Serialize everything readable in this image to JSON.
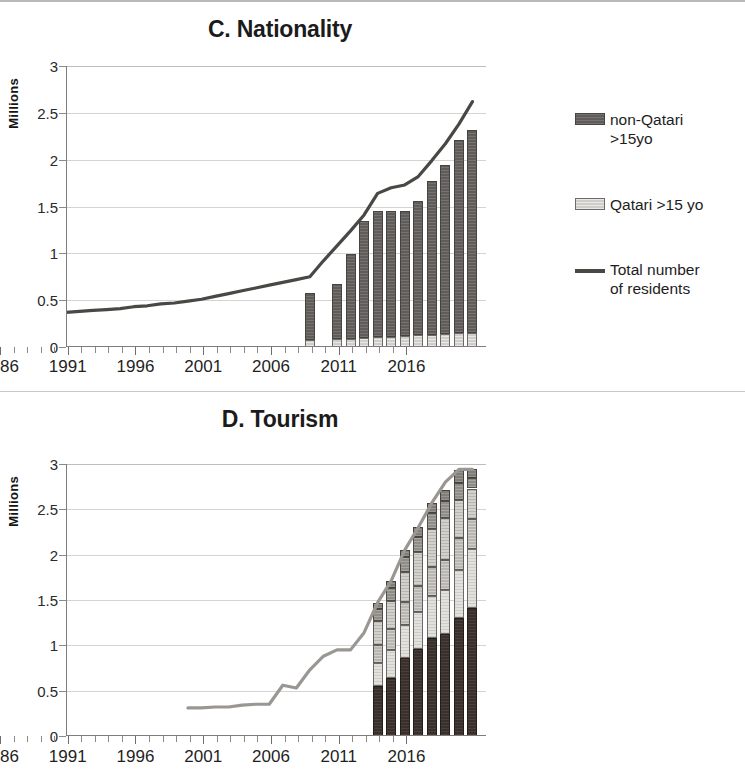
{
  "figure": {
    "panels": [
      "C. Nationality",
      "D. Tourism"
    ]
  },
  "panel_c": {
    "title": "C. Nationality",
    "y_axis_title": "Millions",
    "y_ticks": [
      "3",
      "2.5",
      "2",
      "1.5",
      "1",
      "0.5",
      "0"
    ],
    "x_labels": [
      "1986",
      "1991",
      "1996",
      "2001",
      "2006",
      "2011",
      "2016"
    ],
    "legend": [
      {
        "label": "non-Qatari\n>15yo",
        "type": "swatch",
        "fill": "f-nonqatari",
        "color": "#5f5c59"
      },
      {
        "label": "Qatari >15 yo",
        "type": "swatch",
        "fill": "f-qatari",
        "color": "#cfcdc9"
      },
      {
        "label": "Total number\nof residents",
        "type": "line",
        "fill": "line-swatch",
        "color": "#4a4845"
      }
    ]
  },
  "panel_d": {
    "title": "D. Tourism",
    "y_axis_title": "Millions",
    "y_ticks": [
      "3",
      "2.5",
      "2",
      "1.5",
      "1",
      "0.5",
      "0"
    ],
    "x_labels": [
      "1986",
      "1991",
      "1996",
      "2001",
      "2006",
      "2011",
      "2016"
    ],
    "legend": [
      {
        "label": "Other African\ncountries",
        "type": "swatch",
        "fill": "f-african",
        "color": "#817e79"
      },
      {
        "label": "Americas",
        "type": "swatch",
        "fill": "f-americas",
        "color": "#908d88"
      },
      {
        "label": "Other Arab\ncountries*",
        "type": "swatch",
        "fill": "f-arab",
        "color": "#d3d1cc"
      },
      {
        "label": "Europe",
        "type": "swatch",
        "fill": "f-europe",
        "color": "#b9b6b1"
      },
      {
        "label": "Asia and Oceania",
        "type": "swatch",
        "fill": "f-asia",
        "color": "#e3e1dd"
      },
      {
        "label": "GCC countries**",
        "type": "swatch",
        "fill": "f-gcc",
        "color": "#3a302b"
      },
      {
        "label": "Total number of\nincoming tourists",
        "type": "line",
        "fill": "line-swatch-light",
        "color": "#9a9793"
      }
    ]
  },
  "chart_data": [
    {
      "type": "bar",
      "id": "panel-c",
      "title": "C. Nationality",
      "xlabel": "",
      "ylabel": "Millions",
      "ylim": [
        0,
        3
      ],
      "ytick_step": 0.5,
      "xlim": [
        1986,
        2017
      ],
      "grid": true,
      "legend_position": "right",
      "stacked": true,
      "bar_categories": [
        2004,
        2006,
        2007,
        2008,
        2009,
        2010,
        2011,
        2012,
        2013,
        2014,
        2015,
        2016
      ],
      "series": [
        {
          "name": "Qatari >15 yo",
          "stack_order": 0,
          "values": [
            0.07,
            0.09,
            0.09,
            0.1,
            0.11,
            0.11,
            0.12,
            0.13,
            0.13,
            0.14,
            0.15,
            0.15
          ]
        },
        {
          "name": "non-Qatari >15yo",
          "stack_order": 1,
          "values": [
            0.51,
            0.58,
            0.9,
            1.25,
            1.34,
            1.34,
            1.33,
            1.43,
            1.64,
            1.8,
            2.06,
            2.17
          ]
        }
      ],
      "bar_totals": [
        0.58,
        0.67,
        0.99,
        1.35,
        1.45,
        1.45,
        1.45,
        1.56,
        1.77,
        1.94,
        2.21,
        2.32
      ],
      "line_series": {
        "name": "Total number of residents",
        "x": [
          1986,
          1987,
          1988,
          1989,
          1990,
          1991,
          1992,
          1993,
          1994,
          1995,
          1996,
          1997,
          1998,
          1999,
          2000,
          2001,
          2002,
          2003,
          2004,
          2005,
          2006,
          2007,
          2008,
          2009,
          2010,
          2011,
          2012,
          2013,
          2014,
          2015,
          2016
        ],
        "y": [
          0.37,
          0.38,
          0.39,
          0.4,
          0.41,
          0.43,
          0.44,
          0.46,
          0.47,
          0.49,
          0.51,
          0.54,
          0.57,
          0.6,
          0.63,
          0.66,
          0.69,
          0.72,
          0.75,
          0.92,
          1.08,
          1.24,
          1.41,
          1.64,
          1.7,
          1.73,
          1.82,
          1.99,
          2.17,
          2.38,
          2.62
        ]
      }
    },
    {
      "type": "bar",
      "id": "panel-d",
      "title": "D. Tourism",
      "xlabel": "",
      "ylabel": "Millions",
      "ylim": [
        0,
        3
      ],
      "ytick_step": 0.5,
      "xlim": [
        1986,
        2017
      ],
      "grid": true,
      "legend_position": "right",
      "stacked": true,
      "bar_categories": [
        2009,
        2010,
        2011,
        2012,
        2013,
        2014,
        2015,
        2016
      ],
      "series": [
        {
          "name": "GCC countries**",
          "stack_order": 0,
          "values": [
            0.55,
            0.64,
            0.86,
            0.96,
            1.08,
            1.12,
            1.3,
            1.41
          ]
        },
        {
          "name": "Asia and Oceania",
          "stack_order": 1,
          "values": [
            0.25,
            0.31,
            0.36,
            0.41,
            0.46,
            0.49,
            0.53,
            0.65
          ]
        },
        {
          "name": "Europe",
          "stack_order": 2,
          "values": [
            0.2,
            0.23,
            0.26,
            0.29,
            0.32,
            0.33,
            0.35,
            0.33
          ]
        },
        {
          "name": "Other Arab countries*",
          "stack_order": 3,
          "values": [
            0.27,
            0.31,
            0.33,
            0.37,
            0.42,
            0.46,
            0.42,
            0.34
          ]
        },
        {
          "name": "Americas",
          "stack_order": 4,
          "values": [
            0.13,
            0.14,
            0.16,
            0.17,
            0.18,
            0.19,
            0.19,
            0.12
          ]
        },
        {
          "name": "Other African countries",
          "stack_order": 5,
          "values": [
            0.07,
            0.08,
            0.08,
            0.1,
            0.11,
            0.12,
            0.14,
            0.09
          ]
        }
      ],
      "bar_totals": [
        1.47,
        1.71,
        2.05,
        2.3,
        2.57,
        2.71,
        2.93,
        2.94
      ],
      "line_series": {
        "name": "Total number of incoming tourists",
        "x": [
          1995,
          1996,
          1997,
          1998,
          1999,
          2000,
          2001,
          2002,
          2003,
          2004,
          2005,
          2006,
          2007,
          2008,
          2009,
          2010,
          2011,
          2012,
          2013,
          2014,
          2015,
          2016
        ],
        "y": [
          0.31,
          0.31,
          0.32,
          0.32,
          0.34,
          0.35,
          0.35,
          0.56,
          0.53,
          0.73,
          0.88,
          0.95,
          0.95,
          1.14,
          1.47,
          1.71,
          2.05,
          2.3,
          2.57,
          2.8,
          2.94,
          2.94
        ]
      }
    }
  ]
}
